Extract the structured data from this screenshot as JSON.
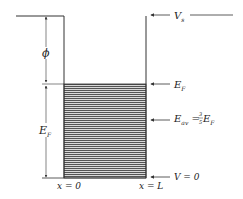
{
  "figure": {
    "type": "potential-well-energy-diagram",
    "colors": {
      "line": "#333333",
      "hatch": "#555555",
      "background": "#ffffff"
    }
  },
  "labels": {
    "vacuum_level": {
      "main": "V",
      "sub": "s"
    },
    "fermi_level": {
      "main": "E",
      "sub": "F"
    },
    "average_energy": {
      "main": "E",
      "sub": "av",
      "eq": " = ",
      "num": "3",
      "den": "5",
      "tail_main": " E",
      "tail_sub": "F"
    },
    "bottom_potential": "V = 0",
    "left_position": "x = 0",
    "right_position": "x = L",
    "work_function": "ϕ",
    "fermi_depth": {
      "main": "E",
      "sub": "F"
    }
  }
}
